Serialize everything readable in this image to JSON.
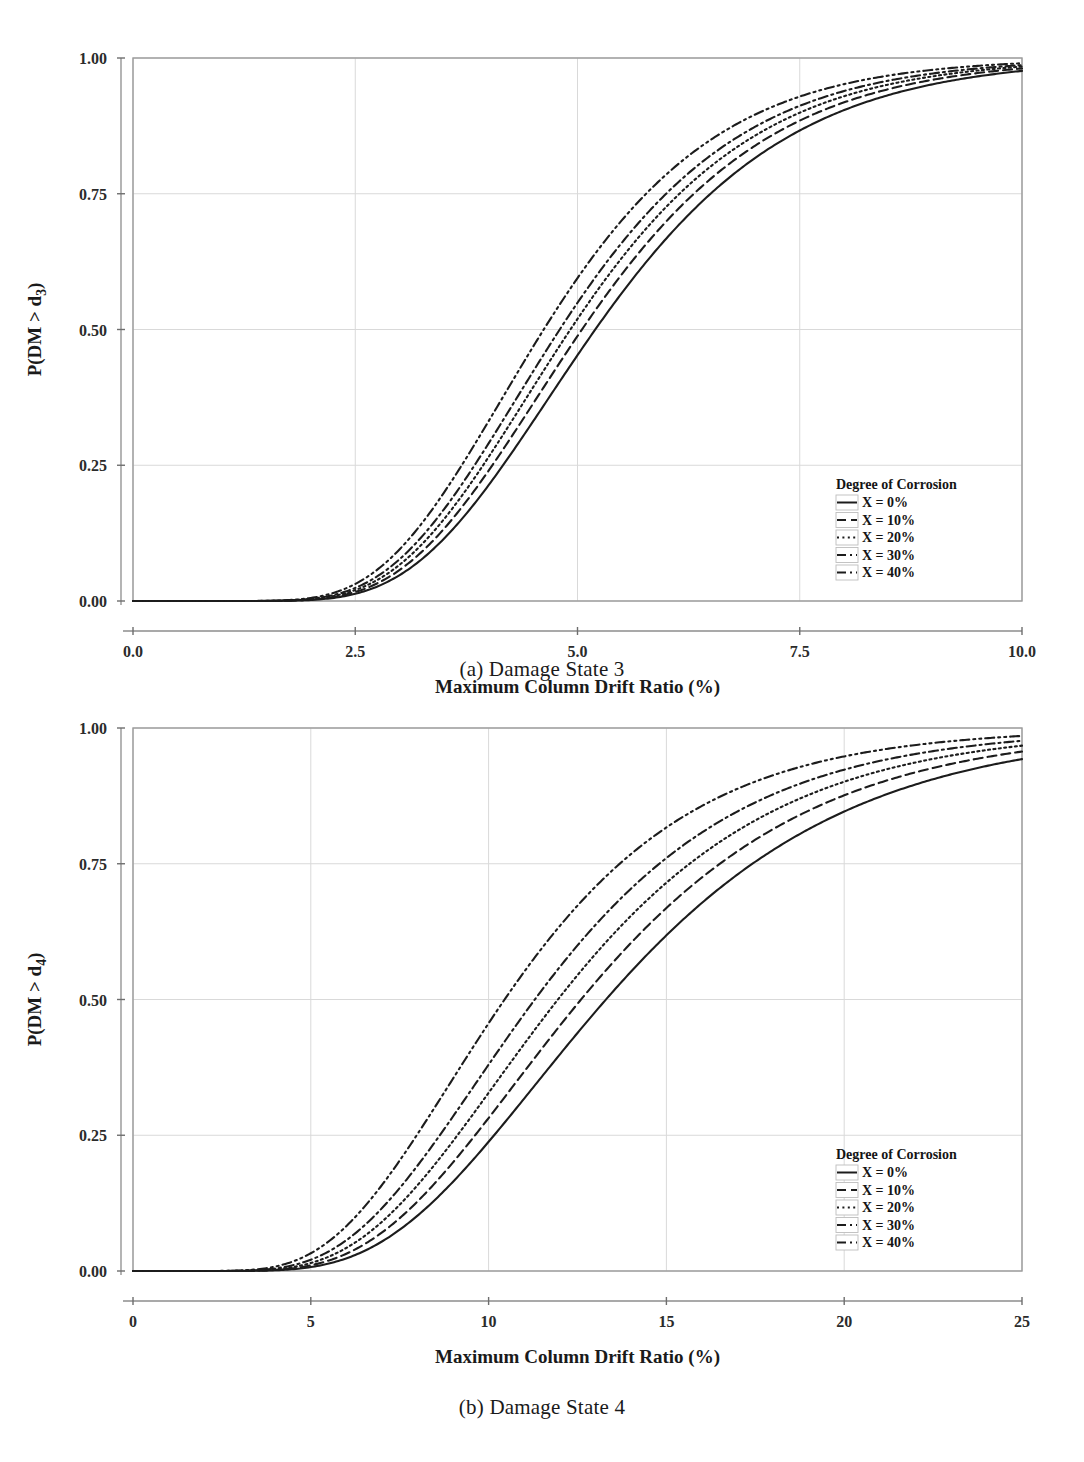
{
  "figure": {
    "panels": [
      {
        "id": "a",
        "caption": "(a) Damage State 3",
        "xlabel": "Maximum Column Drift Ratio (%)",
        "ylabel_main": "P(DM > d",
        "ylabel_sub": "3",
        "ylabel_close": ")",
        "legend_title": "Degree of Corrosion"
      },
      {
        "id": "b",
        "caption": "(b) Damage State 4",
        "xlabel": "Maximum Column Drift Ratio (%)",
        "ylabel_main": "P(DM > d",
        "ylabel_sub": "4",
        "ylabel_close": ")",
        "legend_title": "Degree of Corrosion"
      }
    ]
  },
  "chart_data": [
    {
      "type": "line",
      "panel": "a",
      "title": "(a) Damage State 3",
      "xlabel": "Maximum Column Drift Ratio (%)",
      "ylabel": "P(DM > d3)",
      "xlim": [
        0,
        10
      ],
      "ylim": [
        0.0,
        1.0
      ],
      "xticks": [
        0.0,
        2.5,
        5.0,
        7.5,
        10.0
      ],
      "xtick_labels": [
        "0.0",
        "2.5",
        "5.0",
        "7.5",
        "10.0"
      ],
      "yticks": [
        0.0,
        0.25,
        0.5,
        0.75,
        1.0
      ],
      "ytick_labels": [
        "0.00",
        "0.25",
        "0.50",
        "0.75",
        "1.00"
      ],
      "grid": true,
      "legend_position": "lower-right-inside",
      "legend_title": "Degree of Corrosion",
      "curve_model": "lognormal-cdf",
      "series": [
        {
          "name": "X = 0%",
          "dash": "solid",
          "median": 5.2,
          "beta": 0.33,
          "x": [
            0,
            1,
            2,
            2.5,
            3,
            3.5,
            4,
            4.5,
            5,
            5.5,
            6,
            6.5,
            7,
            7.5,
            8,
            8.5,
            9,
            9.5,
            10
          ],
          "values": [
            0.0,
            0.0,
            0.003,
            0.012,
            0.035,
            0.082,
            0.157,
            0.256,
            0.369,
            0.482,
            0.587,
            0.677,
            0.752,
            0.812,
            0.858,
            0.894,
            0.921,
            0.941,
            0.956
          ]
        },
        {
          "name": "X = 10%",
          "dash": "dashed",
          "median": 5.05,
          "beta": 0.33,
          "x": [
            0,
            1,
            2,
            2.5,
            3,
            3.5,
            4,
            4.5,
            5,
            5.5,
            6,
            6.5,
            7,
            7.5,
            8,
            8.5,
            9,
            9.5,
            10
          ],
          "values": [
            0.0,
            0.0,
            0.004,
            0.016,
            0.046,
            0.103,
            0.19,
            0.301,
            0.421,
            0.536,
            0.638,
            0.723,
            0.791,
            0.845,
            0.886,
            0.916,
            0.939,
            0.956,
            0.968
          ]
        },
        {
          "name": "X = 20%",
          "dash": "dotted",
          "median": 4.92,
          "beta": 0.33,
          "x": [
            0,
            1,
            2,
            2.5,
            3,
            3.5,
            4,
            4.5,
            5,
            5.5,
            6,
            6.5,
            7,
            7.5,
            8,
            8.5,
            9,
            9.5,
            10
          ],
          "values": [
            0.0,
            0.0,
            0.005,
            0.021,
            0.058,
            0.124,
            0.221,
            0.341,
            0.465,
            0.58,
            0.679,
            0.759,
            0.821,
            0.869,
            0.905,
            0.931,
            0.95,
            0.964,
            0.974
          ]
        },
        {
          "name": "X = 30%",
          "dash": "dashdot",
          "median": 4.8,
          "beta": 0.33,
          "x": [
            0,
            1,
            2,
            2.5,
            3,
            3.5,
            4,
            4.5,
            5,
            5.5,
            6,
            6.5,
            7,
            7.5,
            8,
            8.5,
            9,
            9.5,
            10
          ],
          "values": [
            0.0,
            0.0,
            0.006,
            0.026,
            0.071,
            0.147,
            0.255,
            0.382,
            0.509,
            0.623,
            0.718,
            0.793,
            0.85,
            0.892,
            0.923,
            0.945,
            0.961,
            0.972,
            0.98
          ]
        },
        {
          "name": "X = 40%",
          "dash": "dashdotdot",
          "median": 4.62,
          "beta": 0.33,
          "x": [
            0,
            1,
            2,
            2.5,
            3,
            3.5,
            4,
            4.5,
            5,
            5.5,
            6,
            6.5,
            7,
            7.5,
            8,
            8.5,
            9,
            9.5,
            10
          ],
          "values": [
            0.0,
            0.0,
            0.009,
            0.035,
            0.093,
            0.185,
            0.31,
            0.448,
            0.577,
            0.687,
            0.775,
            0.84,
            0.888,
            0.922,
            0.945,
            0.962,
            0.974,
            0.982,
            0.987
          ]
        }
      ]
    },
    {
      "type": "line",
      "panel": "b",
      "title": "(b) Damage State 4",
      "xlabel": "Maximum Column Drift Ratio (%)",
      "ylabel": "P(DM > d4)",
      "xlim": [
        0,
        25
      ],
      "ylim": [
        0.0,
        1.0
      ],
      "xticks": [
        0,
        5,
        10,
        15,
        20,
        25
      ],
      "xtick_labels": [
        "0",
        "5",
        "10",
        "15",
        "20",
        "25"
      ],
      "yticks": [
        0.0,
        0.25,
        0.5,
        0.75,
        1.0
      ],
      "ytick_labels": [
        "0.00",
        "0.25",
        "0.50",
        "0.75",
        "1.00"
      ],
      "grid": true,
      "legend_position": "lower-right-inside",
      "legend_title": "Degree of Corrosion",
      "curve_model": "lognormal-cdf",
      "series": [
        {
          "name": "X = 0%",
          "dash": "solid",
          "median": 13.3,
          "beta": 0.4,
          "x": [
            0,
            2,
            4,
            5,
            6,
            7,
            8,
            9,
            10,
            11,
            12,
            13,
            14,
            15,
            16,
            17,
            18,
            19,
            20,
            21,
            22,
            23,
            24,
            25
          ],
          "values": [
            0.0,
            0.0,
            0.002,
            0.008,
            0.022,
            0.049,
            0.09,
            0.144,
            0.208,
            0.277,
            0.348,
            0.417,
            0.482,
            0.543,
            0.598,
            0.647,
            0.691,
            0.73,
            0.764,
            0.794,
            0.82,
            0.843,
            0.863,
            0.881
          ]
        },
        {
          "name": "X = 10%",
          "dash": "dashed",
          "median": 12.6,
          "beta": 0.4,
          "x": [
            0,
            2,
            4,
            5,
            6,
            7,
            8,
            9,
            10,
            11,
            12,
            13,
            14,
            15,
            16,
            17,
            18,
            19,
            20,
            21,
            22,
            23,
            24,
            25
          ],
          "values": [
            0.0,
            0.0,
            0.003,
            0.011,
            0.03,
            0.063,
            0.112,
            0.175,
            0.247,
            0.322,
            0.398,
            0.471,
            0.538,
            0.599,
            0.654,
            0.702,
            0.744,
            0.781,
            0.812,
            0.84,
            0.864,
            0.885,
            0.903,
            0.918
          ]
        },
        {
          "name": "X = 20%",
          "dash": "dotted",
          "median": 11.95,
          "beta": 0.4,
          "x": [
            0,
            2,
            4,
            5,
            6,
            7,
            8,
            9,
            10,
            11,
            12,
            13,
            14,
            15,
            16,
            17,
            18,
            19,
            20,
            21,
            22,
            23,
            24,
            25
          ],
          "values": [
            0.0,
            0.001,
            0.005,
            0.015,
            0.039,
            0.079,
            0.136,
            0.208,
            0.288,
            0.37,
            0.45,
            0.526,
            0.594,
            0.655,
            0.708,
            0.754,
            0.793,
            0.827,
            0.855,
            0.879,
            0.9,
            0.918,
            0.933,
            0.945
          ]
        },
        {
          "name": "X = 30%",
          "dash": "dashdot",
          "median": 11.3,
          "beta": 0.4,
          "x": [
            0,
            2,
            4,
            5,
            6,
            7,
            8,
            9,
            10,
            11,
            12,
            13,
            14,
            15,
            16,
            17,
            18,
            19,
            20,
            21,
            22,
            23,
            24,
            25
          ],
          "values": [
            0.0,
            0.001,
            0.007,
            0.02,
            0.05,
            0.098,
            0.165,
            0.246,
            0.334,
            0.422,
            0.506,
            0.583,
            0.651,
            0.71,
            0.76,
            0.803,
            0.838,
            0.868,
            0.893,
            0.913,
            0.93,
            0.944,
            0.956,
            0.965
          ]
        },
        {
          "name": "X = 40%",
          "dash": "dashdotdot",
          "median": 10.45,
          "beta": 0.4,
          "x": [
            0,
            2,
            4,
            5,
            6,
            7,
            8,
            9,
            10,
            11,
            12,
            13,
            14,
            15,
            16,
            17,
            18,
            19,
            20,
            21,
            22,
            23,
            24,
            25
          ],
          "values": [
            0.0,
            0.002,
            0.012,
            0.031,
            0.072,
            0.134,
            0.215,
            0.309,
            0.406,
            0.5,
            0.587,
            0.664,
            0.73,
            0.785,
            0.831,
            0.868,
            0.898,
            0.922,
            0.941,
            0.955,
            0.966,
            0.975,
            0.982,
            0.987
          ]
        }
      ]
    }
  ],
  "legend": {
    "title": "Degree of Corrosion",
    "entries": [
      {
        "label": "X = 0%",
        "dash": "solid"
      },
      {
        "label": "X = 10%",
        "dash": "dashed"
      },
      {
        "label": "X = 20%",
        "dash": "dotted"
      },
      {
        "label": "X = 30%",
        "dash": "dashdot"
      },
      {
        "label": "X = 40%",
        "dash": "dashdotdot"
      }
    ]
  },
  "colors": {
    "curve": "#1c1c1c",
    "grid": "#d9d9d9",
    "frame": "#9a9a9a",
    "text": "#1a1a1a",
    "background": "#ffffff"
  }
}
